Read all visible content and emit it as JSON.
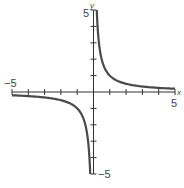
{
  "chart_data": {
    "type": "line",
    "title": "",
    "function": "y = 1/x",
    "xlabel": "x",
    "ylabel": "y",
    "xlim": [
      -5,
      5
    ],
    "ylim": [
      -5,
      5
    ],
    "grid": false,
    "tick_step": 1,
    "tick_labels": {
      "x_min": "−5",
      "x_max": "5",
      "y_max": "5",
      "y_min": "−5"
    },
    "series": [
      {
        "name": "right-branch",
        "x": [
          0.2,
          0.25,
          0.333,
          0.5,
          0.75,
          1,
          1.5,
          2,
          2.5,
          3,
          3.5,
          4,
          4.5,
          5
        ],
        "y": [
          5,
          4,
          3,
          2,
          1.333,
          1,
          0.667,
          0.5,
          0.4,
          0.333,
          0.286,
          0.25,
          0.222,
          0.2
        ]
      },
      {
        "name": "left-branch",
        "x": [
          -5,
          -4.5,
          -4,
          -3.5,
          -3,
          -2.5,
          -2,
          -1.5,
          -1,
          -0.75,
          -0.5,
          -0.333,
          -0.25,
          -0.2
        ],
        "y": [
          -0.2,
          -0.222,
          -0.25,
          -0.286,
          -0.333,
          -0.4,
          -0.5,
          -0.667,
          -1,
          -1.333,
          -2,
          -3,
          -4,
          -5
        ]
      }
    ],
    "colors": {
      "axis": "#333333",
      "curve": "#4a4a4a"
    }
  }
}
